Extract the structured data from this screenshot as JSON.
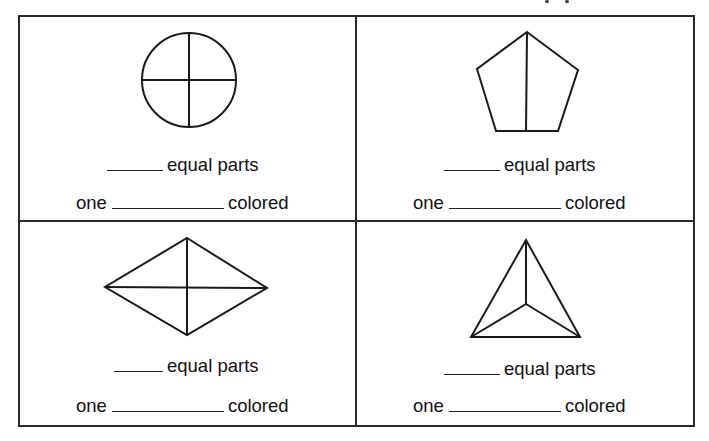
{
  "worksheet": {
    "line_color": "#2a2a2a",
    "cells": [
      {
        "shape": "circle",
        "shape_icon": "circle-divided-into-fourths",
        "parts_blank": "",
        "parts_label": "equal parts",
        "one_label": "one",
        "fraction_blank": "",
        "colored_label": "colored"
      },
      {
        "shape": "pentagon",
        "shape_icon": "pentagon-divided-into-halves",
        "parts_blank": "",
        "parts_label": "equal parts",
        "one_label": "one",
        "fraction_blank": "",
        "colored_label": "colored"
      },
      {
        "shape": "rhombus",
        "shape_icon": "rhombus-divided-into-fourths",
        "parts_blank": "",
        "parts_label": "equal parts",
        "one_label": "one",
        "fraction_blank": "",
        "colored_label": "colored"
      },
      {
        "shape": "triangle",
        "shape_icon": "triangle-divided-into-thirds",
        "parts_blank": "",
        "parts_label": "equal parts",
        "one_label": "one",
        "fraction_blank": "",
        "colored_label": "colored"
      }
    ]
  }
}
